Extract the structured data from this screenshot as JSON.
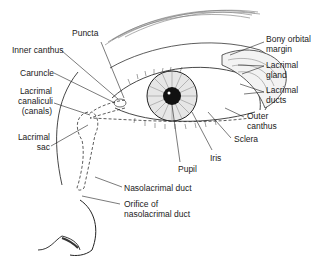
{
  "diagram": {
    "labels": {
      "puncta": "Puncta",
      "inner_canthus": "Inner canthus",
      "caruncle": "Caruncle",
      "lacrimal_canaliculi_1": "Lacrimal",
      "lacrimal_canaliculi_2": "canaliculi",
      "lacrimal_canaliculi_3": "(canals)",
      "lacrimal_sac_1": "Lacrimal",
      "lacrimal_sac_2": "sac",
      "bony_orbital_margin_1": "Bony orbital",
      "bony_orbital_margin_2": "margin",
      "lacrimal_gland_1": "Lacrimal",
      "lacrimal_gland_2": "gland",
      "lacrimal_ducts_1": "Lacrimal",
      "lacrimal_ducts_2": "ducts",
      "outer_canthus_1": "Outer",
      "outer_canthus_2": "canthus",
      "sclera": "Sclera",
      "iris": "Iris",
      "pupil": "Pupil",
      "nasolacrimal_duct": "Nasolacrimal duct",
      "orifice_1": "Orifice of",
      "orifice_2": "nasolacrimal duct"
    }
  }
}
